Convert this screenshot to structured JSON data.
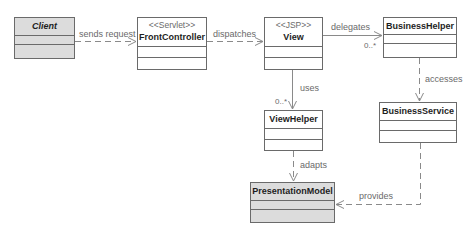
{
  "diagram": {
    "type": "UML class diagram",
    "classes": [
      {
        "id": "client",
        "name": "Client",
        "stereotype": "",
        "italic": true,
        "shaded": true
      },
      {
        "id": "front_controller",
        "name": "FrontController",
        "stereotype": "<<Servlet>>",
        "italic": false,
        "shaded": false
      },
      {
        "id": "view",
        "name": "View",
        "stereotype": "<<JSP>>",
        "italic": false,
        "shaded": false
      },
      {
        "id": "business_helper",
        "name": "BusinessHelper",
        "stereotype": "",
        "italic": false,
        "shaded": false
      },
      {
        "id": "business_service",
        "name": "BusinessService",
        "stereotype": "",
        "italic": false,
        "shaded": false
      },
      {
        "id": "view_helper",
        "name": "ViewHelper",
        "stereotype": "",
        "italic": false,
        "shaded": false
      },
      {
        "id": "presentation_model",
        "name": "PresentationModel",
        "stereotype": "",
        "italic": false,
        "shaded": true
      }
    ],
    "relations": [
      {
        "id": "sends_request",
        "from": "Client",
        "to": "FrontController",
        "label": "sends request",
        "style": "dashed",
        "multiplicity": ""
      },
      {
        "id": "dispatches",
        "from": "FrontController",
        "to": "View",
        "label": "dispatches",
        "style": "dashed",
        "multiplicity": ""
      },
      {
        "id": "delegates",
        "from": "View",
        "to": "BusinessHelper",
        "label": "delegates",
        "style": "solid",
        "multiplicity": "0..*"
      },
      {
        "id": "uses",
        "from": "View",
        "to": "ViewHelper",
        "label": "uses",
        "style": "solid",
        "multiplicity": "0..*"
      },
      {
        "id": "accesses",
        "from": "BusinessHelper",
        "to": "BusinessService",
        "label": "accesses",
        "style": "dashed",
        "multiplicity": ""
      },
      {
        "id": "adapts",
        "from": "ViewHelper",
        "to": "PresentationModel",
        "label": "adapts",
        "style": "dashed",
        "multiplicity": ""
      },
      {
        "id": "provides",
        "from": "BusinessService",
        "to": "PresentationModel",
        "label": "provides",
        "style": "dashed",
        "multiplicity": ""
      }
    ]
  }
}
